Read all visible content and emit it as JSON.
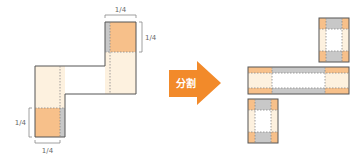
{
  "colors": {
    "orange_dark": "#f7c08a",
    "orange_light": "#fdf1df",
    "grey": "#c8c8c8",
    "outline": "#555555",
    "dotted": "#888888",
    "arrow": "#f28a2a"
  },
  "left_figure": {
    "dim_labels": {
      "top_width": "1/4",
      "top_height": "1/4",
      "bottom_height": "1/4",
      "bottom_width": "1/4"
    }
  },
  "arrow": {
    "label": "分割"
  },
  "right_figure": {
    "pieces": [
      "top-piece",
      "middle-piece",
      "bottom-piece"
    ]
  }
}
